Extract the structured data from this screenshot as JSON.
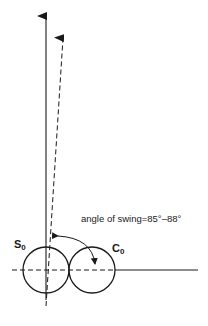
{
  "diagram": {
    "annotation": {
      "angle_label": "angle of swing=85°–88°"
    },
    "circles": [
      {
        "id": "s0",
        "label_main": "S",
        "label_sub": "0"
      },
      {
        "id": "c0",
        "label_main": "C",
        "label_sub": "0"
      }
    ],
    "colors": {
      "stroke": "#1a1a1a",
      "background": "#ffffff"
    }
  }
}
